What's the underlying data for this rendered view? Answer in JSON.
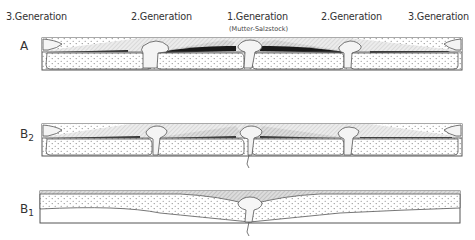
{
  "generations": [
    {
      "label": "3.Generation",
      "x": 6
    },
    {
      "label": "2.Generation",
      "x": 131
    },
    {
      "label": "1.Generation",
      "x": 227
    },
    {
      "label": "2.Generation",
      "x": 321
    },
    {
      "label": "3.Generation",
      "x": 408
    }
  ],
  "subtitle": "(Mutter-Salzstock)",
  "rows": [
    {
      "id": "A",
      "label": "A",
      "sub": ""
    },
    {
      "id": "B2",
      "label": "B",
      "sub": "2"
    },
    {
      "id": "B1",
      "label": "B",
      "sub": "1"
    }
  ],
  "colors": {
    "outline": "#555555",
    "salt_fill": "#f2f2f2",
    "overburden_hatch": "#9a9a9a",
    "rim_syncline_dark": "#1a1a1a",
    "dots": "#7a7a7a"
  }
}
